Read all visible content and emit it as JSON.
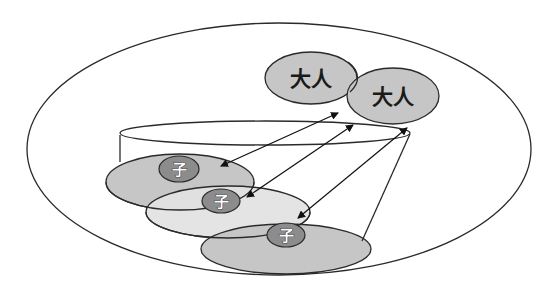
{
  "diagram": {
    "colors": {
      "outline": "#2a2a2a",
      "adult_fill": "#c6c6c6",
      "child_fill_dark": "#c6c6c6",
      "child_fill_light": "#e2e2e2",
      "child_badge_fill": "#8c8c8c",
      "background": "#ffffff"
    },
    "adults": [
      {
        "label": "大人"
      },
      {
        "label": "大人"
      }
    ],
    "children": [
      {
        "label": "子"
      },
      {
        "label": "子"
      },
      {
        "label": "子"
      }
    ]
  }
}
